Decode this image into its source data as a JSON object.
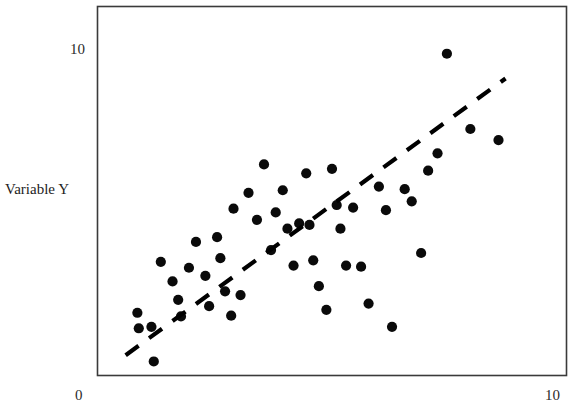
{
  "chart_data": {
    "type": "scatter",
    "title": "",
    "subtitle": "",
    "xlabel": "",
    "ylabel": "Variable Y",
    "xlim": [
      0,
      10
    ],
    "ylim": [
      0,
      10
    ],
    "grid": false,
    "legend": null,
    "x_ticks": [
      {
        "value": 0,
        "label": "0"
      },
      {
        "value": 10,
        "label": "10"
      }
    ],
    "y_ticks": [
      {
        "value": 10,
        "label": "10"
      }
    ],
    "annotations": [
      {
        "name": "trend-line",
        "type": "dashed-line",
        "description": "dashed linear fit line with positive slope",
        "x_start": 0.6,
        "y_start": 0.55,
        "x_end": 8.7,
        "y_end": 8.05
      }
    ],
    "series": [
      {
        "name": "observations",
        "marker": "filled-circle",
        "color": "#0a0a0a",
        "points": [
          [
            0.85,
            1.7
          ],
          [
            0.88,
            1.28
          ],
          [
            1.15,
            1.32
          ],
          [
            1.2,
            0.38
          ],
          [
            1.35,
            3.08
          ],
          [
            1.6,
            2.55
          ],
          [
            1.72,
            2.05
          ],
          [
            1.78,
            1.6
          ],
          [
            1.95,
            2.92
          ],
          [
            2.1,
            3.62
          ],
          [
            2.3,
            2.7
          ],
          [
            2.38,
            1.88
          ],
          [
            2.55,
            3.75
          ],
          [
            2.62,
            3.18
          ],
          [
            2.72,
            2.28
          ],
          [
            2.85,
            1.62
          ],
          [
            2.9,
            4.52
          ],
          [
            3.05,
            2.18
          ],
          [
            3.22,
            4.95
          ],
          [
            3.4,
            4.22
          ],
          [
            3.55,
            5.72
          ],
          [
            3.7,
            3.4
          ],
          [
            3.8,
            4.42
          ],
          [
            3.95,
            5.02
          ],
          [
            4.05,
            3.98
          ],
          [
            4.18,
            2.98
          ],
          [
            4.3,
            4.12
          ],
          [
            4.45,
            5.48
          ],
          [
            4.52,
            4.08
          ],
          [
            4.6,
            3.12
          ],
          [
            4.72,
            2.42
          ],
          [
            4.88,
            1.78
          ],
          [
            5.0,
            5.6
          ],
          [
            5.1,
            4.62
          ],
          [
            5.18,
            3.98
          ],
          [
            5.3,
            2.98
          ],
          [
            5.45,
            4.55
          ],
          [
            5.62,
            2.95
          ],
          [
            5.78,
            1.95
          ],
          [
            6.0,
            5.12
          ],
          [
            6.15,
            4.48
          ],
          [
            6.28,
            1.32
          ],
          [
            6.55,
            5.05
          ],
          [
            6.7,
            4.72
          ],
          [
            6.9,
            3.32
          ],
          [
            7.05,
            5.55
          ],
          [
            7.25,
            6.02
          ],
          [
            7.45,
            8.72
          ],
          [
            7.95,
            6.68
          ],
          [
            8.55,
            6.38
          ]
        ]
      }
    ]
  },
  "labels": {
    "y_axis_title": "Variable Y",
    "y_top_tick": "10",
    "x_left_tick": "0",
    "x_right_tick": "10"
  },
  "colors": {
    "point": "#0a0a0a",
    "line": "#000000",
    "frame": "#3a3a3a",
    "background": "#ffffff",
    "text": "#1d1d1d"
  }
}
